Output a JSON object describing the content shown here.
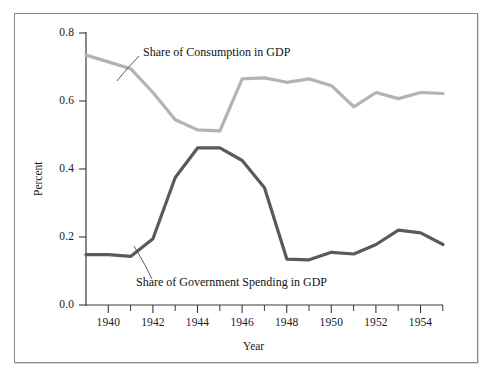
{
  "chart_data": {
    "type": "line",
    "title": "",
    "xlabel": "Year",
    "ylabel": "Percent",
    "xlim": [
      1939,
      1955
    ],
    "ylim": [
      0.0,
      0.8
    ],
    "xticks": [
      "1940",
      "1942",
      "1944",
      "1946",
      "1948",
      "1950",
      "1952",
      "1954"
    ],
    "xtick_values": [
      1940,
      1942,
      1944,
      1946,
      1948,
      1950,
      1952,
      1954
    ],
    "yticks": [
      "0.0",
      "0.2",
      "0.4",
      "0.6",
      "0.8"
    ],
    "ytick_values": [
      0.0,
      0.2,
      0.4,
      0.6,
      0.8
    ],
    "grid": false,
    "legend_position": "inline-annotations",
    "x": [
      1939,
      1940,
      1941,
      1942,
      1943,
      1944,
      1945,
      1946,
      1947,
      1948,
      1949,
      1950,
      1951,
      1952,
      1953,
      1954,
      1955
    ],
    "series": [
      {
        "name": "Share of Consumption in GDP",
        "color": "#b3b3b3",
        "values": [
          0.735,
          0.715,
          0.695,
          0.625,
          0.545,
          0.515,
          0.512,
          0.665,
          0.668,
          0.655,
          0.665,
          0.645,
          0.583,
          0.625,
          0.607,
          0.625,
          0.622
        ]
      },
      {
        "name": "Share of Government Spending in GDP",
        "color": "#5a5a5a",
        "values": [
          0.148,
          0.148,
          0.143,
          0.195,
          0.375,
          0.462,
          0.462,
          0.425,
          0.345,
          0.135,
          0.133,
          0.155,
          0.15,
          0.178,
          0.22,
          0.212,
          0.178
        ]
      }
    ],
    "annotations": [
      {
        "text": "Share of Consumption in GDP",
        "series": "Share of Consumption in GDP"
      },
      {
        "text": "Share of Government Spending in GDP",
        "series": "Share of Government Spending in GDP"
      }
    ]
  },
  "axes": {
    "ylabel": "Percent",
    "xlabel": "Year",
    "ytick_0": "0.0",
    "ytick_1": "0.2",
    "ytick_2": "0.4",
    "ytick_3": "0.6",
    "ytick_4": "0.8",
    "xtick_0": "1940",
    "xtick_1": "1942",
    "xtick_2": "1944",
    "xtick_3": "1946",
    "xtick_4": "1948",
    "xtick_5": "1950",
    "xtick_6": "1952",
    "xtick_7": "1954"
  },
  "labels": {
    "consumption": "Share of Consumption in GDP",
    "government": "Share of Government Spending in GDP"
  }
}
